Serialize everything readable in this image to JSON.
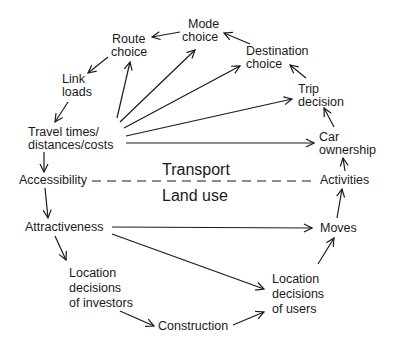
{
  "diagram": {
    "type": "land-use transport feedback cycle",
    "separator": {
      "upper_label": "Transport",
      "lower_label": "Land use",
      "style": "dashed"
    },
    "nodes": {
      "mode_choice": [
        "Mode",
        "choice"
      ],
      "route_choice": [
        "Route",
        "choice"
      ],
      "destination_choice": [
        "Destination",
        "choice"
      ],
      "link_loads": [
        "Link",
        "loads"
      ],
      "trip_decision": [
        "Trip",
        "decision"
      ],
      "travel_times": [
        "Travel times/",
        "distances/costs"
      ],
      "car_ownership": [
        "Car",
        "ownership"
      ],
      "accessibility": [
        "Accessibility"
      ],
      "activities": [
        "Activities"
      ],
      "attractiveness": [
        "Attractiveness"
      ],
      "moves": [
        "Moves"
      ],
      "location_investors": [
        "Location",
        "decisions",
        "of investors"
      ],
      "location_users": [
        "Location",
        "decisions",
        "of users"
      ],
      "construction": [
        "Construction"
      ]
    },
    "edges": [
      [
        "Mode choice",
        "Route choice"
      ],
      [
        "Destination choice",
        "Mode choice"
      ],
      [
        "Trip decision",
        "Destination choice"
      ],
      [
        "Car ownership",
        "Trip decision"
      ],
      [
        "Activities",
        "Car ownership"
      ],
      [
        "Moves",
        "Activities"
      ],
      [
        "Location decisions of users",
        "Moves"
      ],
      [
        "Construction",
        "Location decisions of users"
      ],
      [
        "Location decisions of investors",
        "Construction"
      ],
      [
        "Attractiveness",
        "Location decisions of investors"
      ],
      [
        "Accessibility",
        "Attractiveness"
      ],
      [
        "Travel times/distances/costs",
        "Accessibility"
      ],
      [
        "Link loads",
        "Travel times/distances/costs"
      ],
      [
        "Route choice",
        "Link loads"
      ],
      [
        "Travel times/distances/costs",
        "Route choice"
      ],
      [
        "Travel times/distances/costs",
        "Mode choice"
      ],
      [
        "Travel times/distances/costs",
        "Destination choice"
      ],
      [
        "Travel times/distances/costs",
        "Trip decision"
      ],
      [
        "Travel times/distances/costs",
        "Car ownership"
      ],
      [
        "Attractiveness",
        "Moves"
      ],
      [
        "Attractiveness",
        "Location decisions of users"
      ]
    ]
  }
}
